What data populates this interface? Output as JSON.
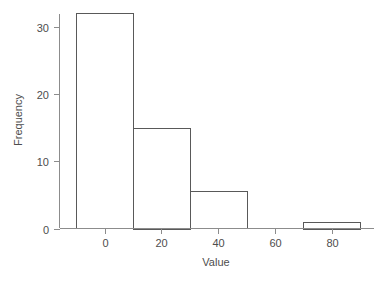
{
  "chart_data": {
    "type": "bar",
    "title": "",
    "subtitle": "",
    "xlabel": "Value",
    "ylabel": "Frequency",
    "xlim": [
      -14,
      94
    ],
    "ylim": [
      0,
      33.5
    ],
    "xticks": [
      0,
      20,
      40,
      60,
      80
    ],
    "xtick_labels": [
      "0",
      "20",
      "40",
      "60",
      "80"
    ],
    "yticks": [
      0,
      10,
      20,
      30
    ],
    "ytick_labels": [
      "0",
      "10",
      "20",
      "30"
    ],
    "grid": false,
    "legend": null,
    "bin_width": 20,
    "bin_edges": [
      -10,
      10,
      30,
      50,
      70,
      90
    ],
    "categories": [
      "-10 to 10",
      "10 to 30",
      "30 to 50",
      "50 to 70",
      "70 to 90"
    ],
    "values": [
      32,
      15,
      5.5,
      0,
      1
    ],
    "bars": [
      {
        "label": "-10 to 10",
        "x0": -10,
        "x1": 10,
        "value": 32
      },
      {
        "label": "10 to 30",
        "x0": 10,
        "x1": 30,
        "value": 15
      },
      {
        "label": "30 to 50",
        "x0": 30,
        "x1": 50,
        "value": 5.5
      },
      {
        "label": "50 to 70",
        "x0": 50,
        "x1": 70,
        "value": 0
      },
      {
        "label": "70 to 90",
        "x0": 70,
        "x1": 90,
        "value": 1
      }
    ],
    "colors": {
      "bar_fill": "#ffffff",
      "bar_stroke": "#595959",
      "axis": "#8c8c8c",
      "text": "#4d4d4d",
      "background": "#ffffff"
    }
  }
}
